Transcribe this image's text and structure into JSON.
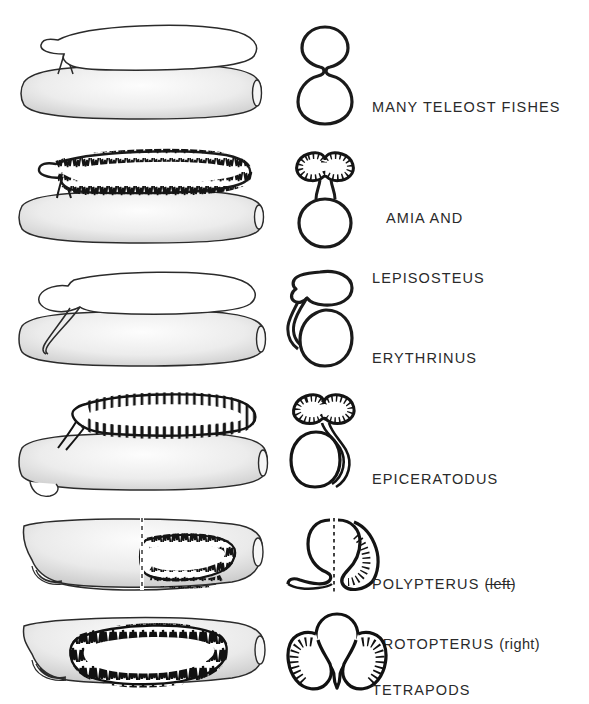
{
  "figure": {
    "background_color": "#ffffff",
    "ink_color": "#1a1a1a",
    "text_color": "#2a2a2a",
    "rows": [
      {
        "id": "teleosts",
        "label_lines": [
          "MANY TELEOST FISHES"
        ],
        "lateral_view": "smooth-dorsal-bladder-with-pneumatic-duct",
        "cross_section": "figure-eight-dorsal-smooth-sac",
        "lining": "smooth",
        "bladder_position": "dorsal",
        "duct_position": "dorsal-midline"
      },
      {
        "id": "amia-lepisosteus",
        "label_lines": [
          "AMIA AND",
          "LEPISOSTEUS"
        ],
        "lateral_view": "alveolar-dorsal-bladder-with-short-duct",
        "cross_section": "bilobed-alveolar-dorsal-sac-on-stalk",
        "lining": "alveolar",
        "bladder_position": "dorsal",
        "duct_position": "dorsal-midline"
      },
      {
        "id": "erythrinus",
        "label_lines": [
          "ERYTHRINUS"
        ],
        "lateral_view": "smooth-dorsal-bladder-with-lateral-duct",
        "cross_section": "smooth-dorsal-sac-with-left-lateral-duct",
        "lining": "smooth",
        "bladder_position": "dorsal",
        "duct_position": "lateral-left"
      },
      {
        "id": "epiceratodus",
        "label_lines": [
          "EPICERATODUS"
        ],
        "lateral_view": "septate-dorsal-lung-with-ventral-looping-duct",
        "cross_section": "bilobed-alveolar-lung-with-duct-looping-right",
        "lining": "septate-alveolar",
        "bladder_position": "dorsal",
        "duct_position": "ventral-loop-right"
      },
      {
        "id": "polypterus-protopterus",
        "label_lines": [
          "POLYPTERUS (left)",
          "PROTOPTERUS (right)"
        ],
        "label_parts": [
          {
            "genus": "POLYPTERUS",
            "side": "(left)",
            "side_struck": true
          },
          {
            "genus": "PROTOPTERUS",
            "side": "(right)",
            "side_struck": false
          }
        ],
        "lateral_view": "split-view-smooth-left-alveolar-right",
        "cross_section": "paired-ventral-lungs-split-by-dashed-midline",
        "lining": "smooth-left-alveolar-right",
        "bladder_position": "ventral",
        "duct_position": "ventral",
        "divider": "dashed-vertical-midline"
      },
      {
        "id": "tetrapods",
        "label_lines": [
          "TETRAPODS"
        ],
        "lateral_view": "large-ventral-alveolar-lung",
        "cross_section": "paired-lateral-alveolar-lungs-flanking-gut",
        "lining": "densely-alveolar",
        "bladder_position": "ventral",
        "duct_position": "ventral-midline"
      }
    ]
  }
}
